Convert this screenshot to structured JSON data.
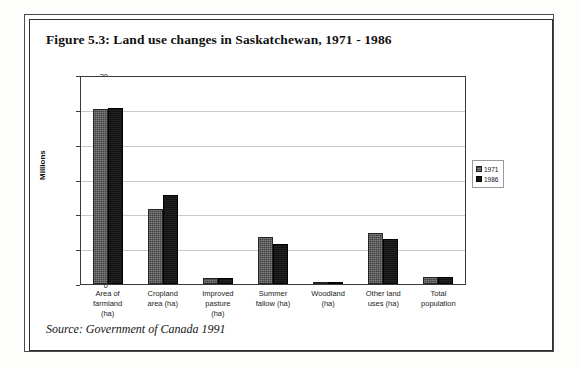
{
  "figure": {
    "title": "Figure 5.3: Land use changes in Saskatchewan, 1971 - 1986",
    "source": "Source:  Government of Canada 1991"
  },
  "chart_data": {
    "type": "bar",
    "title": "Figure 5.3: Land use changes in Saskatchewan, 1971 - 1986",
    "xlabel": "",
    "ylabel": "Millions",
    "ylim": [
      0,
      30
    ],
    "yticks": [
      0,
      5,
      10,
      15,
      20,
      25,
      30
    ],
    "ytick_labels": [
      "0",
      "5",
      "10",
      "15",
      "20",
      "25",
      "30"
    ],
    "grid": true,
    "legend_position": "right",
    "categories": [
      "Area of farmland (ha)",
      "Cropland area (ha)",
      "Improved pasture (ha)",
      "Summer fallow (ha)",
      "Woodland (ha)",
      "Other land uses (ha)",
      "Total population"
    ],
    "category_lines": [
      [
        "Area of",
        "farmland",
        "(ha)"
      ],
      [
        "Cropland",
        "area (ha)"
      ],
      [
        "Improved",
        "pasture",
        "(ha)"
      ],
      [
        "Summer",
        "fallow (ha)"
      ],
      [
        "Woodland",
        "(ha)"
      ],
      [
        "Other land",
        "uses (ha)"
      ],
      [
        "Total",
        "population"
      ]
    ],
    "series": [
      {
        "name": "1971",
        "color": "#5a5a5a",
        "values": [
          25.1,
          10.7,
          0.8,
          6.7,
          0.2,
          7.3,
          1.0
        ]
      },
      {
        "name": "1986",
        "color": "#161616",
        "values": [
          25.2,
          12.8,
          0.9,
          5.8,
          0.2,
          6.4,
          1.0
        ]
      }
    ]
  },
  "legend": {
    "entries": [
      {
        "label": "1971"
      },
      {
        "label": "1986"
      }
    ]
  }
}
